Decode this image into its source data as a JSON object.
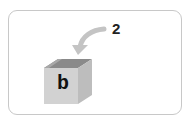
{
  "diagram": {
    "step_number": "2",
    "box_label": "b",
    "colors": {
      "arrow": "#c4c4c4",
      "box_front": "#d2d2d2",
      "box_side": "#bdbdbd",
      "box_top_inner": "#8a8a8a",
      "box_top_edge": "#a8a8a8",
      "card_border": "#c8c8c8"
    }
  }
}
